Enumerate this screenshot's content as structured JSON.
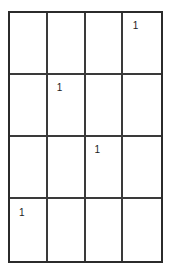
{
  "figure": {
    "kind": "grid-table",
    "rows": 4,
    "columns": 4,
    "line_color": "#3a3a3a",
    "border_color": "#2b2b2b",
    "background_color": "#ffffff",
    "text_color": "#1c1c1c"
  },
  "grid": {
    "cells": [
      [
        {
          "value": "",
          "row": 1,
          "column": 1
        },
        {
          "value": "",
          "row": 1,
          "column": 2
        },
        {
          "value": "",
          "row": 1,
          "column": 3
        },
        {
          "value": "1",
          "row": 1,
          "column": 4
        }
      ],
      [
        {
          "value": "",
          "row": 2,
          "column": 1
        },
        {
          "value": "1",
          "row": 2,
          "column": 2
        },
        {
          "value": "",
          "row": 2,
          "column": 3
        },
        {
          "value": "",
          "row": 2,
          "column": 4
        }
      ],
      [
        {
          "value": "",
          "row": 3,
          "column": 1
        },
        {
          "value": "",
          "row": 3,
          "column": 2
        },
        {
          "value": "1",
          "row": 3,
          "column": 3
        },
        {
          "value": "",
          "row": 3,
          "column": 4
        }
      ],
      [
        {
          "value": "1",
          "row": 4,
          "column": 1
        },
        {
          "value": "",
          "row": 4,
          "column": 2
        },
        {
          "value": "",
          "row": 4,
          "column": 3
        },
        {
          "value": "",
          "row": 4,
          "column": 4
        }
      ]
    ]
  }
}
